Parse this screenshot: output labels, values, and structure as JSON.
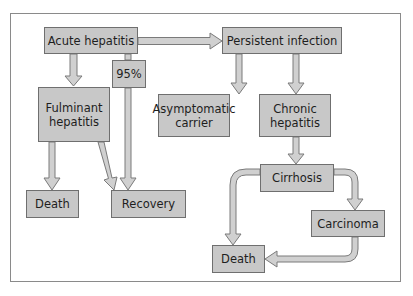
{
  "diagram": {
    "type": "flowchart",
    "colors": {
      "box_fill": "#c8c8c8",
      "box_border": "#6f6f6f",
      "arrow_fill": "#d0d0d0",
      "arrow_stroke": "#7a7a7a",
      "frame": "#8a8a8a",
      "text": "#1e1e1e"
    },
    "nodes": {
      "acute_hepatitis": "Acute hepatitis",
      "percent_95": "95%",
      "persistent_infection": "Persistent infection",
      "fulminant_hepatitis": "Fulminant hepatitis",
      "asymptomatic_carrier": "Asymptomatic carrier",
      "chronic_hepatitis": "Chronic hepatitis",
      "death_left": "Death",
      "recovery": "Recovery",
      "cirrhosis": "Cirrhosis",
      "carcinoma": "Carcinoma",
      "death_bottom": "Death"
    },
    "edges": [
      {
        "from": "Acute hepatitis",
        "to": "Persistent infection"
      },
      {
        "from": "Acute hepatitis",
        "to": "Fulminant hepatitis"
      },
      {
        "from": "Acute hepatitis",
        "to": "Recovery",
        "label": "95%"
      },
      {
        "from": "Fulminant hepatitis",
        "to": "Death"
      },
      {
        "from": "Fulminant hepatitis",
        "to": "Recovery"
      },
      {
        "from": "Persistent infection",
        "to": "Asymptomatic carrier"
      },
      {
        "from": "Persistent infection",
        "to": "Chronic hepatitis"
      },
      {
        "from": "Chronic hepatitis",
        "to": "Cirrhosis"
      },
      {
        "from": "Cirrhosis",
        "to": "Death"
      },
      {
        "from": "Cirrhosis",
        "to": "Carcinoma"
      },
      {
        "from": "Carcinoma",
        "to": "Death"
      }
    ]
  }
}
